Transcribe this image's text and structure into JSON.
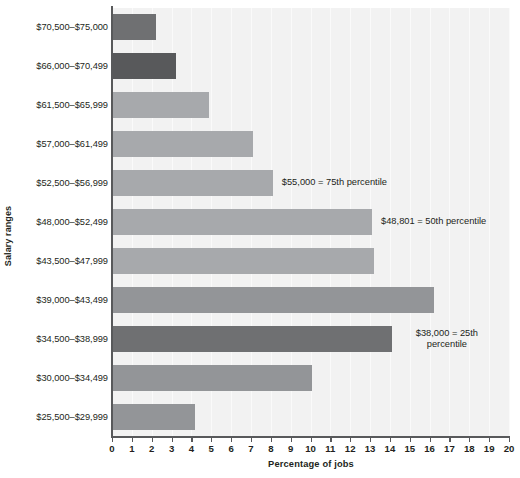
{
  "chart_data": {
    "type": "bar",
    "orientation": "horizontal",
    "title": "",
    "xlabel": "Percentage of jobs",
    "ylabel": "Salary ranges",
    "xlim": [
      0,
      20
    ],
    "xticks": [
      0,
      1,
      2,
      3,
      4,
      5,
      6,
      7,
      8,
      9,
      10,
      11,
      12,
      13,
      14,
      15,
      16,
      17,
      18,
      19,
      20
    ],
    "grid": "vertical",
    "legend": "none",
    "categories": [
      "$70,500–$75,000",
      "$66,000–$70,499",
      "$61,500–$65,999",
      "$57,000–$61,499",
      "$52,500–$56,999",
      "$48,000–$52,499",
      "$43,500–$47,999",
      "$39,000–$43,499",
      "$34,500–$38,999",
      "$30,000–$34,499",
      "$25,500–$29,999"
    ],
    "values": [
      2.2,
      3.2,
      4.9,
      7.1,
      8.1,
      13.1,
      13.2,
      16.2,
      14.1,
      10.1,
      4.2
    ],
    "bar_colors": [
      "#6f7072",
      "#58595b",
      "#a7a9ac",
      "#a7a9ac",
      "#a7a9ac",
      "#a7a9ac",
      "#a7a9ac",
      "#939598",
      "#6f7072",
      "#939598",
      "#939598"
    ],
    "plot_background": "#f2f2f2",
    "gridline_color": "#fafafa",
    "axis_color": "#58595b",
    "annotations": [
      {
        "text": "$55,000 = 75th percentile",
        "category": "$52,500–$56,999",
        "lines": [
          "$55,000 = 75th percentile"
        ]
      },
      {
        "text": "$48,801 = 50th percentile",
        "category": "$48,000–$52,499",
        "lines": [
          "$48,801 = 50th percentile"
        ]
      },
      {
        "text": "$38,000 = 25th percentile",
        "category": "$34,500–$38,999",
        "lines": [
          "$38,000 = 25th",
          "percentile"
        ]
      }
    ]
  },
  "axes": {
    "y_title": "Salary ranges",
    "x_title": "Percentage of jobs"
  },
  "tick_labels": [
    "0",
    "1",
    "2",
    "3",
    "4",
    "5",
    "6",
    "7",
    "8",
    "9",
    "10",
    "11",
    "12",
    "13",
    "14",
    "15",
    "16",
    "17",
    "18",
    "19",
    "20"
  ],
  "category_labels": [
    "$70,500–$75,000",
    "$66,000–$70,499",
    "$61,500–$65,999",
    "$57,000–$61,499",
    "$52,500–$56,999",
    "$48,000–$52,499",
    "$43,500–$47,999",
    "$39,000–$43,499",
    "$34,500–$38,999",
    "$30,000–$34,499",
    "$25,500–$29,999"
  ],
  "annotation_labels": {
    "p75": "$55,000 = 75th percentile",
    "p50": "$48,801 = 50th percentile",
    "p25_line1": "$38,000 = 25th",
    "p25_line2": "percentile"
  }
}
